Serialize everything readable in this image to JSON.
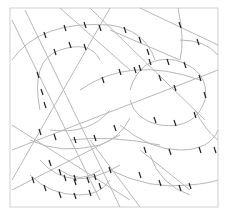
{
  "diagram": {
    "kind": "abstract line drawing",
    "background": "#ffffff",
    "frame": {
      "x": 10,
      "y": 8,
      "width": 208,
      "height": 199,
      "stroke": "#cfcfcf"
    },
    "line_color": "#b8b8b8",
    "tick_color": "#222222",
    "straight_lines": [
      {
        "x1": 12,
        "y1": 20,
        "x2": 100,
        "y2": 200
      },
      {
        "x1": 25,
        "y1": 10,
        "x2": 120,
        "y2": 207
      },
      {
        "x1": 60,
        "y1": 8,
        "x2": 130,
        "y2": 70
      },
      {
        "x1": 90,
        "y1": 8,
        "x2": 205,
        "y2": 120
      },
      {
        "x1": 140,
        "y1": 8,
        "x2": 218,
        "y2": 45
      },
      {
        "x1": 110,
        "y1": 30,
        "x2": 180,
        "y2": 60
      },
      {
        "x1": 12,
        "y1": 125,
        "x2": 130,
        "y2": 200
      },
      {
        "x1": 12,
        "y1": 180,
        "x2": 110,
        "y2": 8
      },
      {
        "x1": 12,
        "y1": 150,
        "x2": 218,
        "y2": 70
      },
      {
        "x1": 12,
        "y1": 190,
        "x2": 120,
        "y2": 135
      },
      {
        "x1": 140,
        "y1": 150,
        "x2": 190,
        "y2": 190
      },
      {
        "x1": 90,
        "y1": 140,
        "x2": 140,
        "y2": 207
      }
    ],
    "curves": [
      {
        "d": "M 12 60 Q 40 20 110 25 Q 145 30 155 60"
      },
      {
        "d": "M 40 110 Q 30 60 60 50 Q 90 40 100 60"
      },
      {
        "d": "M 50 130 Q 90 135 110 110"
      },
      {
        "d": "M 80 90 Q 130 55 200 80"
      },
      {
        "d": "M 130 90 Q 140 55 175 60 Q 210 70 205 100 Q 195 130 160 125 Q 135 120 130 100"
      },
      {
        "d": "M 178 8 Q 185 40 180 60"
      },
      {
        "d": "M 180 40 Q 205 40 218 55"
      },
      {
        "d": "M 30 140 Q 60 155 100 145 Q 120 138 130 118"
      },
      {
        "d": "M 120 125 Q 150 150 180 150 Q 210 150 218 130"
      },
      {
        "d": "M 40 160 Q 70 195 120 165"
      },
      {
        "d": "M 60 170 Q 80 185 100 170"
      },
      {
        "d": "M 30 175 Q 50 195 80 195 Q 100 195 110 180"
      },
      {
        "d": "M 70 140 Q 110 135 160 145"
      },
      {
        "d": "M 110 170 Q 150 190 190 185 Q 210 183 218 180"
      },
      {
        "d": "M 150 155 Q 160 185 190 195"
      },
      {
        "d": "M 195 110 Q 205 130 218 140"
      }
    ],
    "ticks": [
      [
        45,
        35
      ],
      [
        65,
        28
      ],
      [
        85,
        25
      ],
      [
        100,
        28
      ],
      [
        125,
        30
      ],
      [
        140,
        40
      ],
      [
        148,
        52
      ],
      [
        38,
        75
      ],
      [
        42,
        92
      ],
      [
        45,
        105
      ],
      [
        55,
        52
      ],
      [
        70,
        45
      ],
      [
        85,
        47
      ],
      [
        103,
        80
      ],
      [
        120,
        72
      ],
      [
        140,
        68
      ],
      [
        160,
        78
      ],
      [
        175,
        88
      ],
      [
        135,
        70
      ],
      [
        150,
        62
      ],
      [
        168,
        62
      ],
      [
        185,
        65
      ],
      [
        200,
        78
      ],
      [
        205,
        95
      ],
      [
        195,
        115
      ],
      [
        175,
        123
      ],
      [
        155,
        120
      ],
      [
        180,
        25
      ],
      [
        198,
        42
      ],
      [
        40,
        132
      ],
      [
        55,
        137
      ],
      [
        75,
        140
      ],
      [
        95,
        138
      ],
      [
        115,
        128
      ],
      [
        145,
        150
      ],
      [
        170,
        152
      ],
      [
        200,
        150
      ],
      [
        50,
        163
      ],
      [
        60,
        172
      ],
      [
        75,
        178
      ],
      [
        95,
        177
      ],
      [
        110,
        170
      ],
      [
        65,
        178
      ],
      [
        75,
        182
      ],
      [
        88,
        180
      ],
      [
        33,
        180
      ],
      [
        45,
        188
      ],
      [
        60,
        195
      ],
      [
        75,
        196
      ],
      [
        90,
        193
      ],
      [
        100,
        186
      ],
      [
        140,
        175
      ],
      [
        160,
        183
      ],
      [
        180,
        188
      ],
      [
        190,
        186
      ],
      [
        215,
        150
      ]
    ]
  }
}
